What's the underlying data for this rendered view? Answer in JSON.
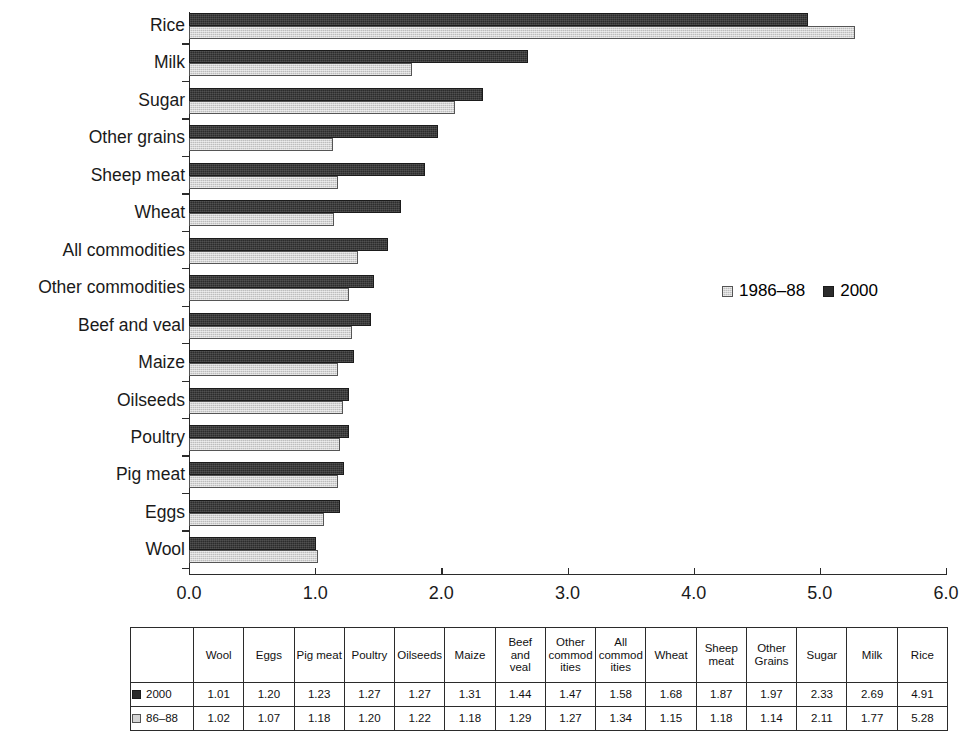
{
  "chart_data": {
    "type": "bar",
    "orientation": "horizontal",
    "title": "",
    "subtitle": "",
    "xlabel": "",
    "ylabel": "",
    "xlim": [
      0.0,
      6.0
    ],
    "xticks": [
      "0.0",
      "1.0",
      "2.0",
      "3.0",
      "4.0",
      "5.0",
      "6.0"
    ],
    "xtick_values": [
      0.0,
      1.0,
      2.0,
      3.0,
      4.0,
      5.0,
      6.0
    ],
    "grid": false,
    "legend_position": "inside-right",
    "categories": [
      "Rice",
      "Milk",
      "Sugar",
      "Other grains",
      "Sheep meat",
      "Wheat",
      "All commodities",
      "Other commodities",
      "Beef and veal",
      "Maize",
      "Oilseeds",
      "Poultry",
      "Pig meat",
      "Eggs",
      "Wool"
    ],
    "series": [
      {
        "name": "2000",
        "color": "#2c2c2c",
        "values": [
          4.91,
          2.69,
          2.33,
          1.97,
          1.87,
          1.68,
          1.58,
          1.47,
          1.44,
          1.31,
          1.27,
          1.27,
          1.23,
          1.2,
          1.01
        ]
      },
      {
        "name": "1986–88",
        "color": "#bdbdbd",
        "values": [
          5.28,
          1.77,
          2.11,
          1.14,
          1.18,
          1.15,
          1.34,
          1.27,
          1.29,
          1.18,
          1.22,
          1.2,
          1.18,
          1.07,
          1.02
        ]
      }
    ]
  },
  "legend": {
    "items": [
      {
        "label": "1986–88",
        "swatch": "s8688"
      },
      {
        "label": "2000",
        "swatch": "s2000"
      }
    ]
  },
  "table": {
    "headers": [
      "Wool",
      "Eggs",
      "Pig meat",
      "Poultry",
      "Oilseeds",
      "Maize",
      "Beef and veal",
      "Other commod ities",
      "All commod ities",
      "Wheat",
      "Sheep meat",
      "Other Grains",
      "Sugar",
      "Milk",
      "Rice"
    ],
    "header_lines": [
      [
        "Wool"
      ],
      [
        "Eggs"
      ],
      [
        "Pig meat"
      ],
      [
        "Poultry"
      ],
      [
        "Oilseeds"
      ],
      [
        "Maize"
      ],
      [
        "Beef",
        "and",
        "veal"
      ],
      [
        "Other",
        "commod",
        "ities"
      ],
      [
        "All",
        "commod",
        "ities"
      ],
      [
        "Wheat"
      ],
      [
        "Sheep",
        "meat"
      ],
      [
        "Other",
        "Grains"
      ],
      [
        "Sugar"
      ],
      [
        "Milk"
      ],
      [
        "Rice"
      ]
    ],
    "rows": [
      {
        "label": "2000",
        "swatch": "s2000",
        "values": [
          "1.01",
          "1.20",
          "1.23",
          "1.27",
          "1.27",
          "1.31",
          "1.44",
          "1.47",
          "1.58",
          "1.68",
          "1.87",
          "1.97",
          "2.33",
          "2.69",
          "4.91"
        ]
      },
      {
        "label": "86–88",
        "swatch": "s8688",
        "values": [
          "1.02",
          "1.07",
          "1.18",
          "1.20",
          "1.22",
          "1.18",
          "1.29",
          "1.27",
          "1.34",
          "1.15",
          "1.18",
          "1.14",
          "2.11",
          "1.77",
          "5.28"
        ]
      }
    ]
  }
}
